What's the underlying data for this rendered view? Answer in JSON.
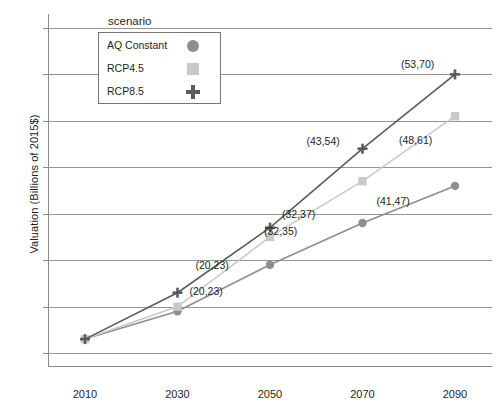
{
  "chart_data": {
    "type": "line",
    "title": "",
    "xlabel": "",
    "ylabel": "Valuation (Billions of 2015$)",
    "x": [
      2010,
      2030,
      2050,
      2070,
      2090
    ],
    "xticklabels": [
      "2010",
      "2030",
      "2050",
      "2070",
      "2090"
    ],
    "yticklabels": [
      "10",
      "20",
      "30",
      "40",
      "50",
      "60",
      "70",
      "80"
    ],
    "yticks": [
      10,
      20,
      30,
      40,
      50,
      60,
      70,
      80
    ],
    "ylim": [
      7,
      83
    ],
    "xlim": [
      2002,
      2098
    ],
    "grid": true,
    "legend_position": "top-left-inside",
    "legend_title": "scenario",
    "series": [
      {
        "name": "AQ Constant",
        "marker": "circle",
        "color": "#8e8e8e",
        "values": [
          13,
          19,
          29,
          38,
          46
        ]
      },
      {
        "name": "RCP4.5",
        "marker": "square",
        "color": "#c9c9c9",
        "values": [
          13,
          20,
          35,
          47,
          61
        ]
      },
      {
        "name": "RCP8.5",
        "marker": "plus",
        "color": "#5b5b5b",
        "values": [
          13,
          23,
          37,
          54,
          70
        ]
      }
    ],
    "annotations": [
      {
        "text": "(20,23)",
        "x": 2030,
        "y": 23,
        "dx": 18,
        "dy": -34
      },
      {
        "text": "(20,23)",
        "x": 2030,
        "y": 20,
        "dx": 12,
        "dy": -22
      },
      {
        "text": "(32,37)",
        "x": 2050,
        "y": 37,
        "dx": 12,
        "dy": -20
      },
      {
        "text": "(32,35)",
        "x": 2050,
        "y": 35,
        "dx": -6,
        "dy": -12
      },
      {
        "text": "(43,54)",
        "x": 2070,
        "y": 54,
        "dx": -56,
        "dy": -14
      },
      {
        "text": "(41,47)",
        "x": 2070,
        "y": 47,
        "dx": 14,
        "dy": 14
      },
      {
        "text": "(53,70)",
        "x": 2090,
        "y": 70,
        "dx": -54,
        "dy": -16
      },
      {
        "text": "(48,61)",
        "x": 2090,
        "y": 61,
        "dx": -56,
        "dy": 18
      }
    ]
  },
  "legend": {
    "title": "scenario",
    "items": [
      {
        "label": "AQ Constant",
        "marker": "circle",
        "color": "#8e8e8e"
      },
      {
        "label": "RCP4.5",
        "marker": "square",
        "color": "#c9c9c9"
      },
      {
        "label": "RCP8.5",
        "marker": "plus",
        "color": "#5b5b5b"
      }
    ]
  }
}
